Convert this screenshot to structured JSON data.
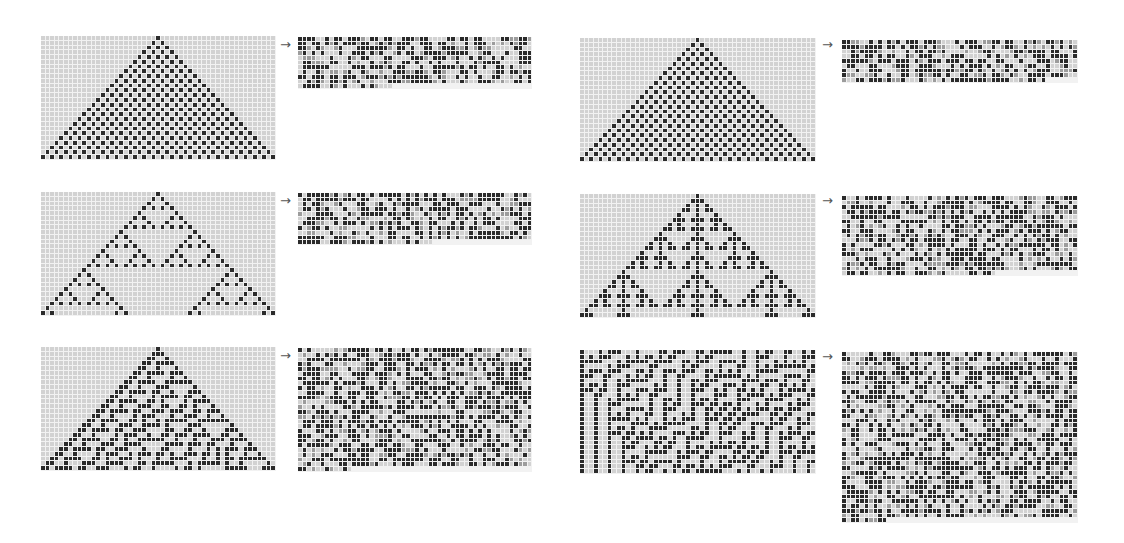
{
  "figure": {
    "colors": {
      "cell_on": "#2b2b2b",
      "cell_off": "#d2d2d2",
      "cell_mid": "#9c9c9c",
      "grid_line": "#f2f2f2"
    },
    "arrow_glyph": "→",
    "rows": [
      {
        "left": {
          "rule": 250,
          "cols": 51,
          "steps": 26,
          "box": {
            "x": 41,
            "y": 36,
            "w": 235,
            "h": 124
          },
          "arrow": {
            "x": 280,
            "y": 40
          },
          "output": {
            "x": 298,
            "y": 37,
            "w": 234,
            "h": 52,
            "cols": 52,
            "rows": 11,
            "last_row_len": 21,
            "seed": 11
          }
        },
        "right": {
          "rule": 50,
          "cols": 51,
          "steps": 26,
          "box": {
            "x": 580,
            "y": 38,
            "w": 236,
            "h": 124
          },
          "arrow": {
            "x": 822,
            "y": 40
          },
          "output": {
            "x": 842,
            "y": 40,
            "w": 236,
            "h": 43,
            "cols": 52,
            "rows": 9,
            "last_row_len": 45,
            "seed": 23
          }
        }
      },
      {
        "left": {
          "rule": 90,
          "cols": 51,
          "steps": 26,
          "box": {
            "x": 41,
            "y": 192,
            "w": 235,
            "h": 124
          },
          "arrow": {
            "x": 280,
            "y": 196
          },
          "output": {
            "x": 298,
            "y": 193,
            "w": 234,
            "h": 52,
            "cols": 52,
            "rows": 11,
            "last_row_len": 30,
            "seed": 37
          }
        },
        "right": {
          "rule": 150,
          "cols": 51,
          "steps": 26,
          "box": {
            "x": 580,
            "y": 194,
            "w": 236,
            "h": 124
          },
          "arrow": {
            "x": 822,
            "y": 196
          },
          "output": {
            "x": 842,
            "y": 196,
            "w": 236,
            "h": 80,
            "cols": 52,
            "rows": 17,
            "last_row_len": 34,
            "seed": 41
          }
        }
      },
      {
        "left": {
          "rule": 30,
          "cols": 51,
          "steps": 26,
          "box": {
            "x": 41,
            "y": 347,
            "w": 235,
            "h": 124
          },
          "arrow": {
            "x": 280,
            "y": 351
          },
          "output": {
            "x": 298,
            "y": 348,
            "w": 234,
            "h": 124,
            "cols": 52,
            "rows": 26,
            "last_row_len": 12,
            "seed": 59
          }
        },
        "right": {
          "rule": 45,
          "cols": 51,
          "steps": 26,
          "random_init": true,
          "init_seed": 7,
          "box": {
            "x": 580,
            "y": 350,
            "w": 236,
            "h": 124
          },
          "arrow": {
            "x": 822,
            "y": 352
          },
          "output": {
            "x": 842,
            "y": 352,
            "w": 236,
            "h": 171,
            "cols": 52,
            "rows": 36,
            "last_row_len": 10,
            "seed": 83
          }
        }
      }
    ]
  }
}
